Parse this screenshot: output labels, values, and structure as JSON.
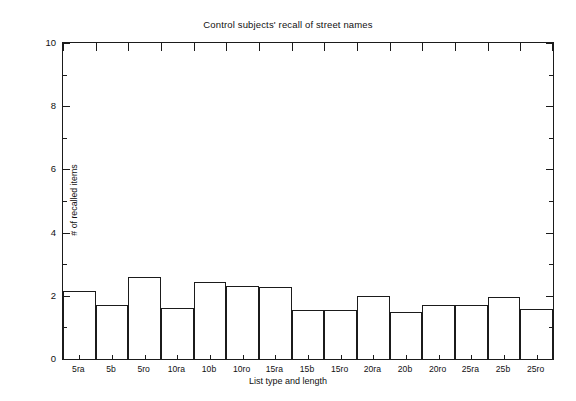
{
  "figure": {
    "background_color": "#ffffff",
    "axis_color": "#1b1b1b"
  },
  "chart_data": {
    "type": "bar",
    "title": "Control subjects' recall of street names",
    "xlabel": "List type and length",
    "ylabel": "# of recalled items",
    "categories": [
      "5ra",
      "5b",
      "5ro",
      "10ra",
      "10b",
      "10ro",
      "15ra",
      "15b",
      "15ro",
      "20ra",
      "20b",
      "20ro",
      "25ra",
      "25b",
      "25ro"
    ],
    "values": [
      2.15,
      1.7,
      2.6,
      1.6,
      2.45,
      2.3,
      2.28,
      1.55,
      1.55,
      2.0,
      1.48,
      1.72,
      1.72,
      1.95,
      1.58
    ],
    "ylim": [
      0,
      10
    ],
    "ytick_labels": [
      "0",
      "2",
      "4",
      "6",
      "8",
      "10"
    ],
    "ytick_values": [
      0,
      2,
      4,
      6,
      8,
      10
    ],
    "grid": false,
    "legend": "none",
    "bar_style": "outline",
    "bar_fill": "none",
    "bar_edge_color": "#1b1b1b"
  }
}
